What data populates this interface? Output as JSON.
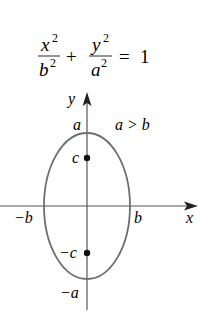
{
  "equation": {
    "term1_num": "x",
    "term1_num_exp": "2",
    "term1_den": "b",
    "term1_den_exp": "2",
    "plus": "+",
    "term2_num": "y",
    "term2_num_exp": "2",
    "term2_den": "a",
    "term2_den_exp": "2",
    "equals": "=",
    "rhs": "1"
  },
  "condition": "a > b",
  "axes": {
    "x_label": "x",
    "y_label": "y"
  },
  "labels": {
    "a": "a",
    "neg_a": "−a",
    "b": "b",
    "neg_b": "−b",
    "c": "c",
    "neg_c": "−c"
  },
  "colors": {
    "ellipse": "#6e6e6e",
    "axis": "#555555",
    "text": "#2a2a2a",
    "focus": "#111111"
  },
  "geometry": {
    "center": [
      87,
      206
    ],
    "rx": 43,
    "ry": 73,
    "focus_offset": 48
  }
}
